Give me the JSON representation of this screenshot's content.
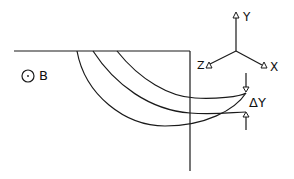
{
  "diagram": {
    "field_symbol": "out-of-page-field-icon",
    "field_label": "B",
    "axes": {
      "y_label": "Y",
      "z_label": "Z",
      "x_label": "X"
    },
    "deflection_label": "ΔY",
    "colors": {
      "stroke": "#1a1a1a",
      "background": "#ffffff"
    }
  }
}
